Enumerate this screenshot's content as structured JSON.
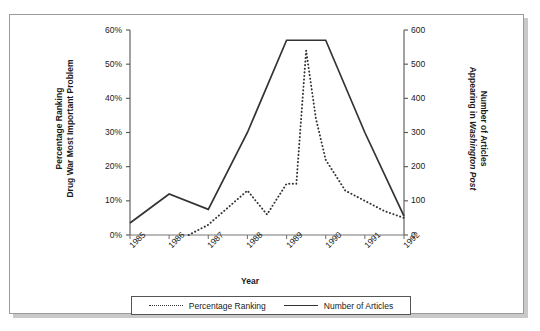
{
  "chart_data": {
    "type": "line",
    "title": "",
    "xlabel": "Year",
    "grid": false,
    "legend_position": "bottom",
    "x_ticks": [
      "1985",
      "1986",
      "1987",
      "1988",
      "1989",
      "1990",
      "1991",
      "1992"
    ],
    "axes": {
      "left": {
        "label_line1": "Percentage Ranking",
        "label_line2": "Drug War Most Important Problem",
        "ticks": [
          "0%",
          "10%",
          "20%",
          "30%",
          "40%",
          "50%",
          "60%"
        ],
        "tick_values": [
          0,
          10,
          20,
          30,
          40,
          50,
          60
        ],
        "ylim": [
          0,
          60
        ]
      },
      "right": {
        "label_line1": "Number of Articles",
        "label_line2_plain": "Appearing in ",
        "label_line2_italic": "Washington Post",
        "ticks": [
          "0",
          "100",
          "200",
          "300",
          "400",
          "500",
          "600"
        ],
        "tick_values": [
          0,
          100,
          200,
          300,
          400,
          500,
          600
        ],
        "ylim": [
          0,
          600
        ]
      }
    },
    "series": [
      {
        "name": "Percentage Ranking",
        "axis": "left",
        "style": "dotted",
        "color": "#333333",
        "x": [
          1986.5,
          1987.0,
          1987.5,
          1988.0,
          1988.5,
          1989.0,
          1989.25,
          1989.5,
          1989.75,
          1990.0,
          1990.5,
          1991.0,
          1991.5,
          1992.0
        ],
        "values": [
          0,
          3,
          8,
          13,
          6,
          15,
          15,
          54,
          34,
          22,
          13,
          10,
          7,
          5
        ]
      },
      {
        "name": "Number of Articles",
        "axis": "right",
        "style": "solid",
        "color": "#333333",
        "x": [
          1985,
          1986,
          1987,
          1988,
          1989,
          1990,
          1991,
          1992
        ],
        "values": [
          35,
          120,
          75,
          300,
          570,
          570,
          300,
          55
        ]
      }
    ]
  },
  "legend": {
    "items": [
      {
        "label": "Percentage Ranking",
        "style": "dotted"
      },
      {
        "label": "Number of Articles",
        "style": "solid"
      }
    ]
  }
}
